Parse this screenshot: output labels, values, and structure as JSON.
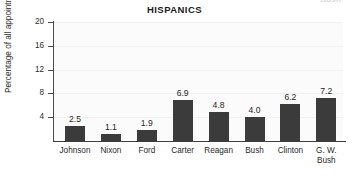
{
  "ghost_text": "Bush",
  "chart_data": {
    "type": "bar",
    "title": "HISPANICS",
    "xlabel": "",
    "ylabel": "Percentage of all appointments",
    "categories": [
      "Johnson",
      "Nixon",
      "Ford",
      "Carter",
      "Reagan",
      "Bush",
      "Clinton",
      "G. W.\nBush"
    ],
    "category_lines": [
      [
        "Johnson"
      ],
      [
        "Nixon"
      ],
      [
        "Ford"
      ],
      [
        "Carter"
      ],
      [
        "Reagan"
      ],
      [
        "Bush"
      ],
      [
        "Clinton"
      ],
      [
        "G. W.",
        "Bush"
      ]
    ],
    "values": [
      2.5,
      1.1,
      1.9,
      6.9,
      4.8,
      4.0,
      6.2,
      7.2
    ],
    "value_labels": [
      "2.5",
      "1.1",
      "1.9",
      "6.9",
      "4.8",
      "4.0",
      "6.2",
      "7.2"
    ],
    "ylim": [
      0,
      20
    ],
    "yticks": [
      4,
      8,
      12,
      16,
      20
    ],
    "ytick_labels": [
      "4",
      "8",
      "12",
      "16",
      "20"
    ],
    "grid": true,
    "legend": false,
    "bar_color": "#3b3b3b",
    "plot_background": "#fbfbfb",
    "axis_color": "#3d3d3d"
  }
}
